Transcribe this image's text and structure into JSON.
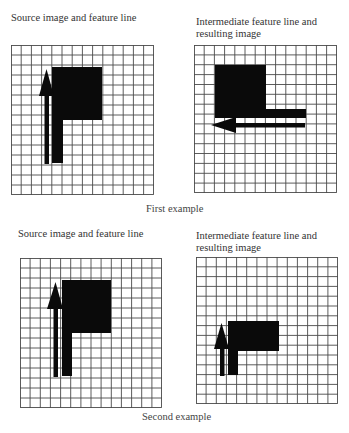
{
  "first_example": {
    "label": "First example",
    "source_panel": {
      "caption": "Source image and feature line",
      "grid": {
        "columns": 14,
        "rows": 15
      },
      "shape": "flag (square with downward stem)",
      "feature_line": "upward arrow along left side of shape"
    },
    "result_panel": {
      "caption_line1": "Intermediate feature line and",
      "caption_line2": "resulting image",
      "grid": {
        "columns": 14,
        "rows": 15
      },
      "shape": "rotated flag (square with rightward bar)",
      "feature_line": "leftward arrow below shape"
    }
  },
  "second_example": {
    "label": "Second example",
    "source_panel": {
      "caption": "Source image and feature line",
      "grid": {
        "columns": 14,
        "rows": 15
      },
      "shape": "flag (square with downward stem)",
      "feature_line": "upward arrow along left side of shape"
    },
    "result_panel": {
      "caption_line1": "Intermediate feature line and",
      "caption_line2": "resulting image",
      "grid": {
        "columns": 14,
        "rows": 15
      },
      "shape": "scaled-down flag (shorter rectangle with stem)",
      "feature_line": "shorter upward arrow along left side of shape"
    }
  },
  "colors": {
    "grid_line": "#4a4a4a",
    "shape_fill": "#0a0a0a",
    "background": "#ffffff"
  }
}
